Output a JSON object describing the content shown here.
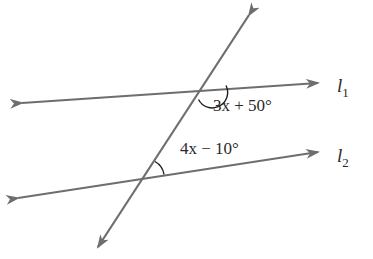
{
  "diagram": {
    "type": "parallel-lines-transversal",
    "colors": {
      "line": "#6e6e6e",
      "arc": "#1e1e1e",
      "text": "#2a2a2a",
      "background": "#ffffff"
    },
    "lines": [
      {
        "id": "l1",
        "label_base": "l",
        "label_sub": "1",
        "x1": 22,
        "y1": 103,
        "x2": 318,
        "y2": 83
      },
      {
        "id": "l2",
        "label_base": "l",
        "label_sub": "2",
        "x1": 18,
        "y1": 198,
        "x2": 318,
        "y2": 152
      }
    ],
    "transversal": {
      "x1": 249,
      "y1": 15,
      "x2": 98,
      "y2": 247
    },
    "angles": [
      {
        "id": "angle-top",
        "at": "l1",
        "expression": "3x + 50°",
        "vertex": [
          206,
          88
        ]
      },
      {
        "id": "angle-bottom",
        "at": "l2",
        "expression": "4x − 10°",
        "vertex": [
          145,
          177
        ]
      }
    ]
  }
}
